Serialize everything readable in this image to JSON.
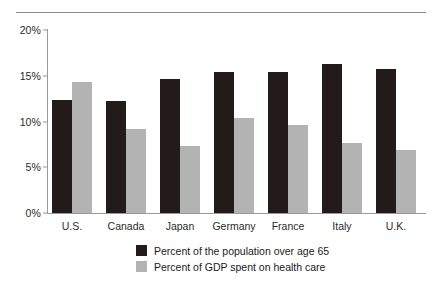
{
  "chart_data": {
    "type": "bar",
    "title": "",
    "subtitle": "",
    "xlabel": "",
    "ylabel": "",
    "ylim": [
      0,
      20
    ],
    "yticks": [
      0,
      5,
      10,
      15,
      20
    ],
    "ytick_labels": [
      "0%",
      "5%",
      "10%",
      "15%",
      "20%"
    ],
    "grid": false,
    "legend_position": "bottom-center",
    "categories": [
      "U.S.",
      "Canada",
      "Japan",
      "Germany",
      "France",
      "Italy",
      "U.K."
    ],
    "series": [
      {
        "name": "Percent of the population over age 65",
        "color": "#231a1a",
        "values": [
          12.3,
          12.2,
          14.7,
          15.4,
          15.4,
          16.3,
          15.7
        ]
      },
      {
        "name": "Percent of GDP spent on health care",
        "color": "#b3b3b3",
        "values": [
          14.3,
          9.2,
          7.3,
          10.4,
          9.6,
          7.6,
          6.9
        ]
      }
    ]
  },
  "colors": {
    "series_dark": "#231a1a",
    "series_light": "#b3b3b3",
    "axis": "#9a9a9a",
    "rule": "#8a8a8a",
    "text": "#1a1a1a",
    "background": "#ffffff"
  }
}
